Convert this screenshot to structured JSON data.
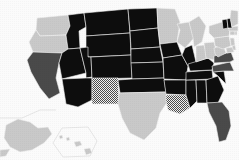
{
  "figure": {
    "type": "choropleth-map",
    "region": "United States",
    "title": "",
    "background_color": "#fbfbfb",
    "border_color": "#f2f2f2"
  },
  "legend_categories": [
    {
      "key": "black",
      "label": "",
      "color": "#0d0d0d",
      "pattern": "solid"
    },
    {
      "key": "darkgray",
      "label": "",
      "color": "#4a4a4a",
      "pattern": "solid"
    },
    {
      "key": "lightgray",
      "label": "",
      "color": "#c9c9c9",
      "pattern": "solid"
    },
    {
      "key": "hatched",
      "label": "",
      "color": "#c9c9c9",
      "pattern": "checker"
    }
  ],
  "chart_data": {
    "type": "map",
    "title": "",
    "xlabel": "",
    "ylabel": "",
    "categories": [
      "black",
      "darkgray",
      "lightgray",
      "hatched"
    ],
    "states": [
      {
        "code": "WA",
        "name": "Washington",
        "category": "lightgray"
      },
      {
        "code": "OR",
        "name": "Oregon",
        "category": "lightgray"
      },
      {
        "code": "CA",
        "name": "California",
        "category": "darkgray"
      },
      {
        "code": "NV",
        "name": "Nevada",
        "category": "black"
      },
      {
        "code": "ID",
        "name": "Idaho",
        "category": "black"
      },
      {
        "code": "MT",
        "name": "Montana",
        "category": "black"
      },
      {
        "code": "WY",
        "name": "Wyoming",
        "category": "black"
      },
      {
        "code": "UT",
        "name": "Utah",
        "category": "black"
      },
      {
        "code": "AZ",
        "name": "Arizona",
        "category": "black"
      },
      {
        "code": "CO",
        "name": "Colorado",
        "category": "black"
      },
      {
        "code": "NM",
        "name": "New Mexico",
        "category": "hatched"
      },
      {
        "code": "ND",
        "name": "North Dakota",
        "category": "black"
      },
      {
        "code": "SD",
        "name": "South Dakota",
        "category": "black"
      },
      {
        "code": "NE",
        "name": "Nebraska",
        "category": "black"
      },
      {
        "code": "KS",
        "name": "Kansas",
        "category": "black"
      },
      {
        "code": "OK",
        "name": "Oklahoma",
        "category": "black"
      },
      {
        "code": "TX",
        "name": "Texas",
        "category": "lightgray"
      },
      {
        "code": "MN",
        "name": "Minnesota",
        "category": "lightgray"
      },
      {
        "code": "IA",
        "name": "Iowa",
        "category": "black"
      },
      {
        "code": "MO",
        "name": "Missouri",
        "category": "black"
      },
      {
        "code": "AR",
        "name": "Arkansas",
        "category": "black"
      },
      {
        "code": "LA",
        "name": "Louisiana",
        "category": "hatched"
      },
      {
        "code": "WI",
        "name": "Wisconsin",
        "category": "lightgray"
      },
      {
        "code": "IL",
        "name": "Illinois",
        "category": "black"
      },
      {
        "code": "MS",
        "name": "Mississippi",
        "category": "black"
      },
      {
        "code": "AL",
        "name": "Alabama",
        "category": "black"
      },
      {
        "code": "TN",
        "name": "Tennessee",
        "category": "black"
      },
      {
        "code": "KY",
        "name": "Kentucky",
        "category": "black"
      },
      {
        "code": "IN",
        "name": "Indiana",
        "category": "lightgray"
      },
      {
        "code": "OH",
        "name": "Ohio",
        "category": "lightgray"
      },
      {
        "code": "MI",
        "name": "Michigan",
        "category": "lightgray"
      },
      {
        "code": "GA",
        "name": "Georgia",
        "category": "black"
      },
      {
        "code": "FL",
        "name": "Florida",
        "category": "darkgray"
      },
      {
        "code": "SC",
        "name": "South Carolina",
        "category": "black"
      },
      {
        "code": "NC",
        "name": "North Carolina",
        "category": "darkgray"
      },
      {
        "code": "VA",
        "name": "Virginia",
        "category": "darkgray"
      },
      {
        "code": "WV",
        "name": "West Virginia",
        "category": "lightgray"
      },
      {
        "code": "PA",
        "name": "Pennsylvania",
        "category": "lightgray"
      },
      {
        "code": "NY",
        "name": "New York",
        "category": "lightgray"
      },
      {
        "code": "MD",
        "name": "Maryland",
        "category": "lightgray"
      },
      {
        "code": "DE",
        "name": "Delaware",
        "category": "lightgray"
      },
      {
        "code": "NJ",
        "name": "New Jersey",
        "category": "lightgray"
      },
      {
        "code": "CT",
        "name": "Connecticut",
        "category": "lightgray"
      },
      {
        "code": "RI",
        "name": "Rhode Island",
        "category": "lightgray"
      },
      {
        "code": "MA",
        "name": "Massachusetts",
        "category": "lightgray"
      },
      {
        "code": "VT",
        "name": "Vermont",
        "category": "black"
      },
      {
        "code": "NH",
        "name": "New Hampshire",
        "category": "black"
      },
      {
        "code": "ME",
        "name": "Maine",
        "category": "lightgray"
      },
      {
        "code": "AK",
        "name": "Alaska",
        "category": "lightgray"
      },
      {
        "code": "HI",
        "name": "Hawaii",
        "category": "lightgray"
      }
    ]
  }
}
